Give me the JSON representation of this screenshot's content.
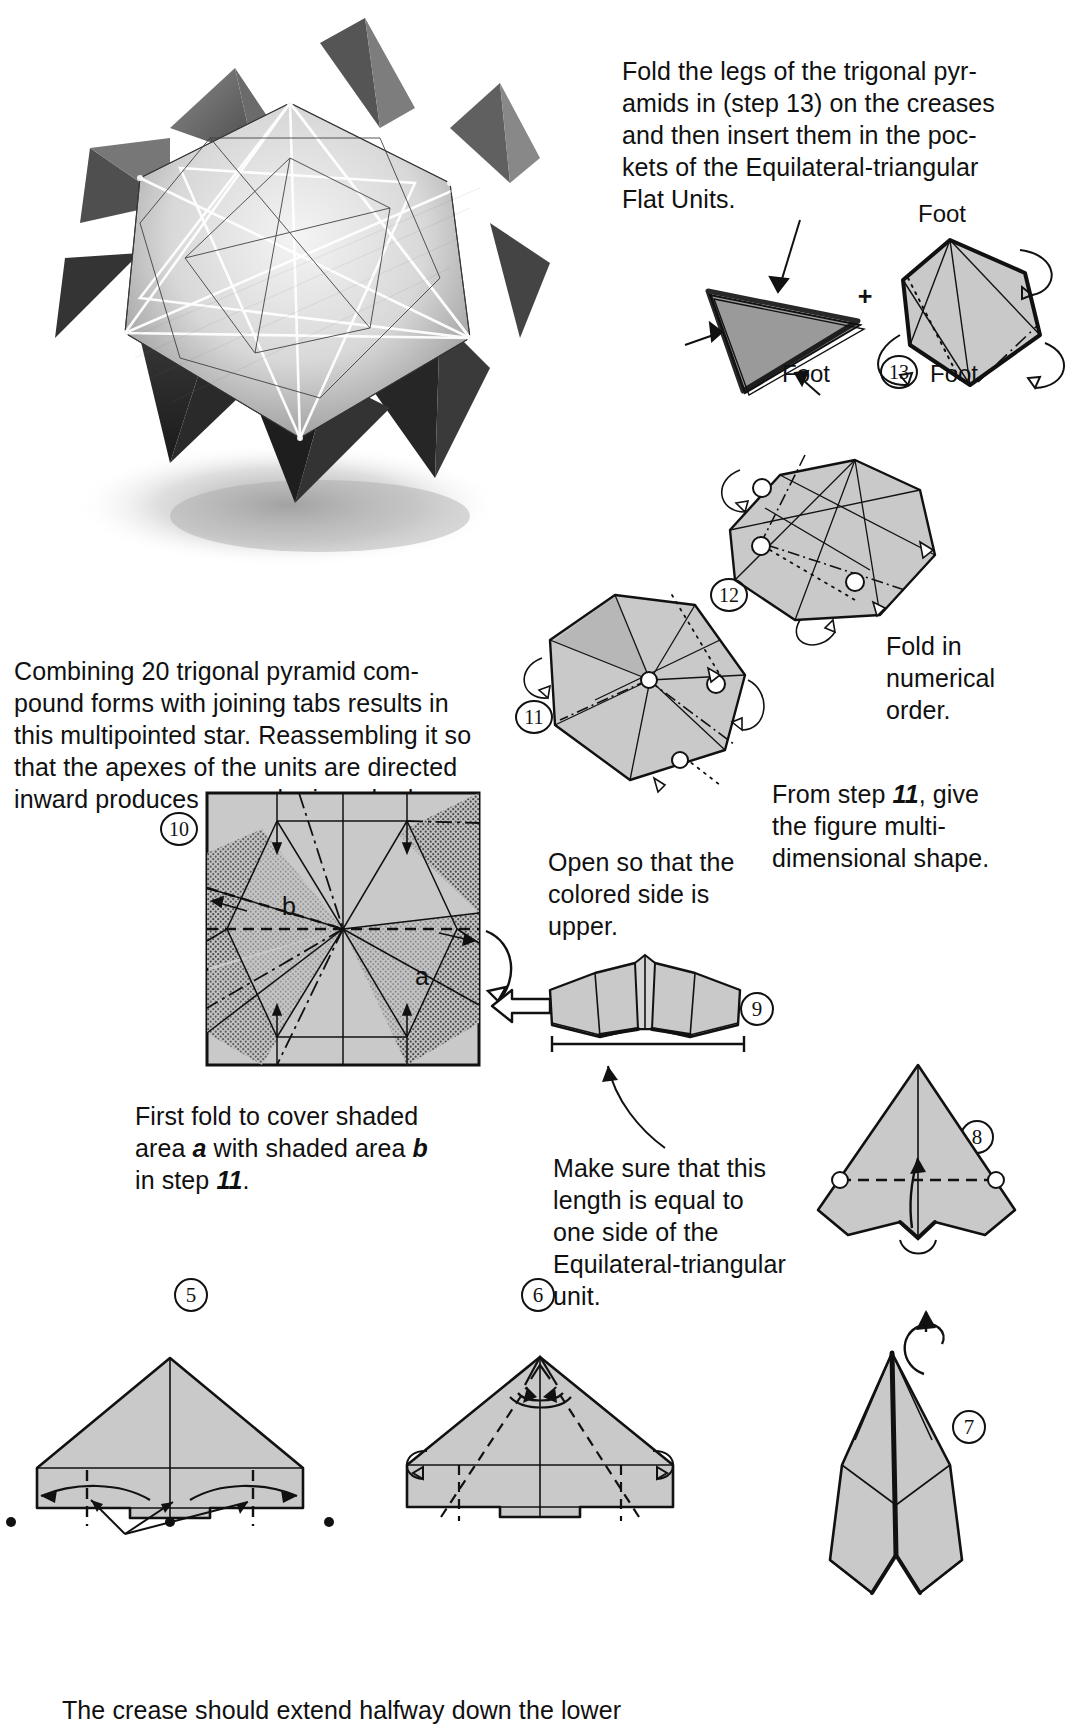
{
  "page": {
    "background_color": "#ffffff",
    "paper_fill": "#c8c8c8",
    "paper_fill_dark": "#9a9a9a",
    "ink_color": "#111111"
  },
  "photo": {
    "caption_alt": "Pencil rendering of a multipointed stellated icosahedron star model with cast shadow",
    "name": "stellated-star-illustration"
  },
  "texts": {
    "intro_fold_legs": "Fold the legs of the trigonal pyr-\namids in (step 13) on the creases\nand then insert them in the poc-\nkets of the Equilateral-triangular\nFlat Units.",
    "combining": "Combining 20 trigonal pyramid com-\npound forms with joining tabs results in\nthis multipointed star. Reassembling it so\nthat the apexes of the units are directed\ninward produces a regular icosahedron.",
    "fold_numerical": "Fold in\nnumerical\norder.",
    "from_step_11": "From step 11, give\nthe figure multi-\ndimensional shape.",
    "open_colored": "Open so that the\ncolored side is\nupper.",
    "first_fold": "First fold to cover shaded\narea a with shaded area b\nin step 11.",
    "make_sure": "Make sure that this\nlength is equal to\none side of the\nEquilateral-triangular\nunit.",
    "bottom_crease": "The crease should extend halfway down the lower"
  },
  "emphasis": {
    "step13_inline": "13",
    "step11_inline_a": "11",
    "step11_inline_b": "11"
  },
  "labels": {
    "foot_top_right": "Foot",
    "foot_bottom_left": "Foot",
    "foot_bottom_right": "Foot",
    "area_a": "a",
    "area_b": "b",
    "plus_sign": "+"
  },
  "steps": [
    {
      "id": "5",
      "label": "5"
    },
    {
      "id": "6",
      "label": "6"
    },
    {
      "id": "7",
      "label": "7"
    },
    {
      "id": "8",
      "label": "8"
    },
    {
      "id": "9",
      "label": "9"
    },
    {
      "id": "10",
      "label": "10"
    },
    {
      "id": "11",
      "label": "11"
    },
    {
      "id": "12",
      "label": "12"
    },
    {
      "id": "13",
      "label": "13"
    }
  ],
  "icons": {
    "arrow_left_hollow": "hollow-left-arrow",
    "fold_arrow": "fold-arrow",
    "rotate_arrow": "rotate-arrow"
  }
}
